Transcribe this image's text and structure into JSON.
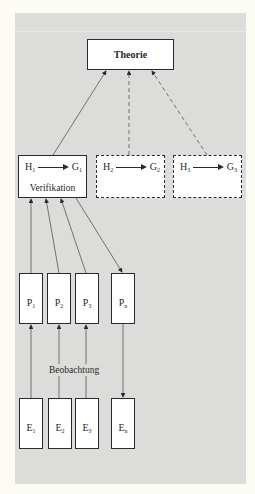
{
  "diagram": {
    "theory": {
      "label": "Theorie"
    },
    "hypotheses": [
      {
        "h": "H",
        "h_sub": "1",
        "g": "G",
        "g_sub": "1",
        "style": "solid",
        "caption": "Verifikation"
      },
      {
        "h": "H",
        "h_sub": "2",
        "g": "G",
        "g_sub": "2",
        "style": "dashed"
      },
      {
        "h": "H",
        "h_sub": "3",
        "g": "G",
        "g_sub": "3",
        "style": "dashed"
      }
    ],
    "propositions": [
      {
        "base": "P",
        "sub": "1"
      },
      {
        "base": "P",
        "sub": "2"
      },
      {
        "base": "P",
        "sub": "3"
      },
      {
        "base": "P",
        "sub": "n"
      }
    ],
    "experiences": [
      {
        "base": "E",
        "sub": "1"
      },
      {
        "base": "E",
        "sub": "2"
      },
      {
        "base": "E",
        "sub": "3"
      },
      {
        "base": "E",
        "sub": "n"
      }
    ],
    "observation_label": "Beobachtung",
    "colors": {
      "background": "#dcdcda",
      "box": "#ffffff",
      "stroke": "#2a2a2a"
    }
  }
}
